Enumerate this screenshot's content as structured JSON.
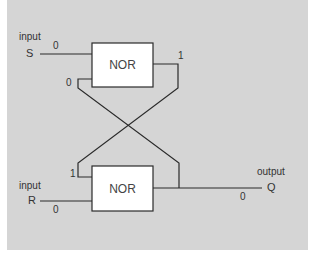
{
  "diagram": {
    "colors": {
      "background": "#d5d5d5",
      "gate_fill": "#ffffff",
      "line": "#2a2a2a",
      "text": "#333333"
    },
    "gates": [
      {
        "id": "gate-top",
        "label": "NOR"
      },
      {
        "id": "gate-bottom",
        "label": "NOR"
      }
    ],
    "inputs": {
      "s": {
        "caption": "input",
        "name": "S",
        "value": "0"
      },
      "r": {
        "caption": "input",
        "name": "R",
        "value": "0"
      }
    },
    "output": {
      "caption": "output",
      "name": "Q",
      "value": "0"
    },
    "feedback": {
      "top_gate_feedback_in": "0",
      "top_gate_out": "1",
      "bottom_gate_feedback_in": "1"
    }
  }
}
